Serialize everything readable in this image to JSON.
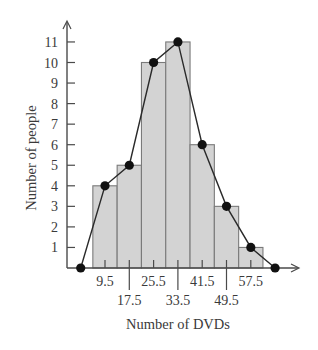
{
  "chart_data": {
    "type": "bar",
    "subtype": "histogram_with_frequency_polygon",
    "title": "",
    "xlabel": "Number of DVDs",
    "ylabel": "Number of people",
    "categories": [
      "9.5",
      "17.5",
      "25.5",
      "33.5",
      "41.5",
      "49.5",
      "57.5"
    ],
    "class_width": 8,
    "values": [
      4,
      5,
      10,
      11,
      6,
      3,
      1
    ],
    "x_tick_labels_upper": [
      "9.5",
      "25.5",
      "41.5",
      "57.5"
    ],
    "x_tick_labels_lower": [
      "17.5",
      "33.5",
      "49.5"
    ],
    "y_ticks": [
      1,
      2,
      3,
      4,
      5,
      6,
      7,
      8,
      9,
      10,
      11
    ],
    "ylim": [
      0,
      11.5
    ],
    "frequency_polygon": {
      "x": [
        1.5,
        9.5,
        17.5,
        25.5,
        33.5,
        41.5,
        49.5,
        57.5,
        65.5
      ],
      "y": [
        0,
        4,
        5,
        10,
        11,
        6,
        3,
        1,
        0
      ]
    },
    "grid": false,
    "legend": null
  },
  "colors": {
    "bar_fill": "#d3d3d3",
    "bar_stroke": "#7a7a7a",
    "line": "#2a2a2a",
    "point": "#111111",
    "axis": "#4a4a4a"
  }
}
